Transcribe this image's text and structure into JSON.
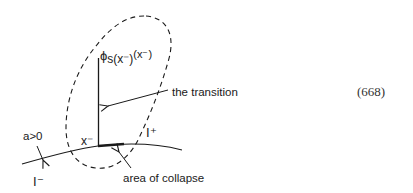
{
  "diagram": {
    "phi_label": {
      "base": "ϕ",
      "subscript": "s(x⁻)",
      "argument": "(x⁻)"
    },
    "transition_label": "the transition",
    "x_minus_label": "x⁻",
    "i_plus_label": "I⁺",
    "i_minus_label": "I⁻",
    "a_label": "a>0",
    "collapse_label": "area of collapse",
    "equation_number": "(668)",
    "colors": {
      "ink": "#1a1a1a",
      "background": "#ffffff"
    }
  }
}
